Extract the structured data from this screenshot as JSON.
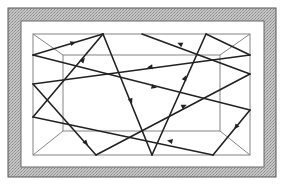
{
  "diagram": {
    "type": "ray-reflection-in-box",
    "frame": {
      "outer": {
        "x": 8,
        "y": 8,
        "w": 268,
        "h": 169
      },
      "inner": {
        "x": 21,
        "y": 21,
        "w": 243,
        "h": 146
      },
      "fill_color": "#b8b8b8",
      "border_color": "#555555"
    },
    "room": {
      "front": {
        "x": 33,
        "y": 34,
        "w": 217,
        "h": 121
      },
      "back": {
        "x": 63,
        "y": 55,
        "w": 157,
        "h": 76
      },
      "line_color": "#777777"
    },
    "ray": {
      "color": "#222222",
      "segments": [
        [
          [
            33,
            55
          ],
          [
            103,
            34
          ]
        ],
        [
          [
            103,
            34
          ],
          [
            33,
            117
          ]
        ],
        [
          [
            103,
            34
          ],
          [
            152,
            155
          ]
        ],
        [
          [
            152,
            155
          ],
          [
            206,
            34
          ]
        ],
        [
          [
            206,
            34
          ],
          [
            250,
            55
          ]
        ],
        [
          [
            250,
            55
          ],
          [
            33,
            84
          ]
        ],
        [
          [
            33,
            84
          ],
          [
            96,
            155
          ]
        ],
        [
          [
            96,
            155
          ],
          [
            250,
            74
          ]
        ],
        [
          [
            250,
            74
          ],
          [
            142,
            34
          ]
        ],
        [
          [
            33,
            55
          ],
          [
            250,
            110
          ]
        ],
        [
          [
            250,
            110
          ],
          [
            213,
            155
          ]
        ],
        [
          [
            213,
            155
          ],
          [
            33,
            117
          ]
        ]
      ],
      "arrows": [
        {
          "x": 73,
          "y": 43,
          "angle": -17
        },
        {
          "x": 83,
          "y": 60,
          "angle": -50
        },
        {
          "x": 131,
          "y": 101,
          "angle": 68
        },
        {
          "x": 185,
          "y": 78,
          "angle": -66
        },
        {
          "x": 180,
          "y": 44,
          "angle": 205
        },
        {
          "x": 150,
          "y": 67,
          "angle": 172
        },
        {
          "x": 86,
          "y": 143,
          "angle": 48
        },
        {
          "x": 184,
          "y": 106,
          "angle": -23
        },
        {
          "x": 154,
          "y": 87,
          "angle": 14
        },
        {
          "x": 236,
          "y": 127,
          "angle": 128
        },
        {
          "x": 170,
          "y": 141,
          "angle": 192
        }
      ]
    }
  }
}
